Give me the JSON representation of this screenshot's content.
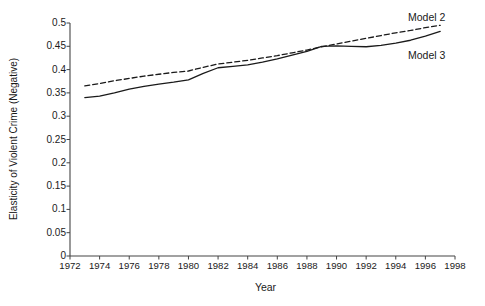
{
  "chart_data": {
    "type": "line",
    "title": "",
    "xlabel": "Year",
    "ylabel": "Elasticity of Violent Crime (Negative)",
    "xlim": [
      1972,
      1998
    ],
    "ylim": [
      0,
      0.5
    ],
    "xticks": [
      1972,
      1974,
      1976,
      1978,
      1980,
      1982,
      1984,
      1986,
      1988,
      1990,
      1992,
      1994,
      1996,
      1998
    ],
    "yticks": [
      0,
      0.05,
      0.1,
      0.15,
      0.2,
      0.25,
      0.3,
      0.35,
      0.4,
      0.45,
      0.5
    ],
    "ytick_labels": [
      "0",
      "0.05",
      "0.1",
      "0.15",
      "0.2",
      "0.25",
      "0.3",
      "0.35",
      "0.4",
      "0.45",
      "0.5"
    ],
    "xtick_labels": [
      "1972",
      "1974",
      "1976",
      "1978",
      "1980",
      "1982",
      "1984",
      "1986",
      "1988",
      "1990",
      "1992",
      "1994",
      "1996",
      "1998"
    ],
    "grid": false,
    "legend_position": "inline-right-annotations",
    "x": [
      1973,
      1974,
      1975,
      1976,
      1977,
      1978,
      1979,
      1980,
      1981,
      1982,
      1983,
      1984,
      1985,
      1986,
      1987,
      1988,
      1989,
      1990,
      1991,
      1992,
      1993,
      1994,
      1995,
      1996,
      1997
    ],
    "series": [
      {
        "name": "Model 2",
        "style": "dashed",
        "color": "#1a1a1a",
        "values": [
          0.365,
          0.37,
          0.376,
          0.381,
          0.386,
          0.39,
          0.394,
          0.397,
          0.405,
          0.412,
          0.416,
          0.42,
          0.425,
          0.43,
          0.436,
          0.442,
          0.449,
          0.455,
          0.461,
          0.467,
          0.473,
          0.479,
          0.484,
          0.49,
          0.495
        ]
      },
      {
        "name": "Model 3",
        "style": "solid",
        "color": "#1a1a1a",
        "values": [
          0.34,
          0.343,
          0.35,
          0.358,
          0.364,
          0.369,
          0.373,
          0.378,
          0.392,
          0.404,
          0.407,
          0.41,
          0.416,
          0.423,
          0.431,
          0.439,
          0.45,
          0.451,
          0.45,
          0.449,
          0.452,
          0.457,
          0.463,
          0.472,
          0.482
        ]
      }
    ],
    "annotations": [
      {
        "text": "Model 2",
        "series": "Model 2"
      },
      {
        "text": "Model 3",
        "series": "Model 3"
      }
    ]
  },
  "axis": {
    "x_title": "Year",
    "y_title": "Elasticity of Violent Crime (Negative)"
  },
  "labels": {
    "model2": "Model 2",
    "model3": "Model 3"
  }
}
